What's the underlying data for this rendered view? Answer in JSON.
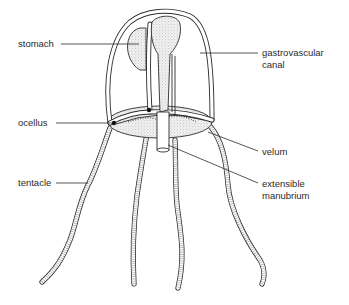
{
  "diagram": {
    "labels": {
      "stomach": "stomach",
      "gastrovascular_canal_line1": "gastrovascular",
      "gastrovascular_canal_line2": "canal",
      "ocellus": "ocellus",
      "velum": "velum",
      "tentacle": "tentacle",
      "extensible_manubrium_line1": "extensible",
      "extensible_manubrium_line2": "manubrium"
    },
    "colors": {
      "line": "#2b2b2b",
      "background": "#ffffff",
      "text": "#2a2a2a"
    }
  }
}
